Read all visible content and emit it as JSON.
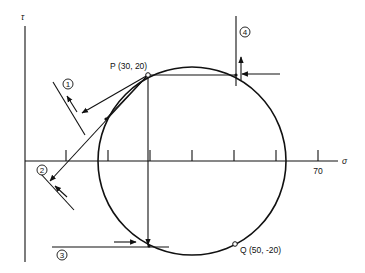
{
  "diagram": {
    "type": "mohr-circle",
    "axes": {
      "x_label": "σ",
      "y_label": "τ",
      "x_tick_values": [
        10,
        20,
        30,
        40,
        50,
        60,
        70
      ],
      "x_tick_labeled": "70"
    },
    "points": {
      "P": {
        "name": "P",
        "label": "P (30, 20)",
        "sigma": 30,
        "tau": 20
      },
      "Q": {
        "name": "Q",
        "label": "Q (50, -20)",
        "sigma": 50,
        "tau": -20
      }
    },
    "circle": {
      "center_sigma": 40,
      "center_tau": 0
    },
    "planes": [
      {
        "id": "1",
        "label": "1"
      },
      {
        "id": "2",
        "label": "2"
      },
      {
        "id": "3",
        "label": "3"
      },
      {
        "id": "4",
        "label": "4"
      }
    ]
  }
}
